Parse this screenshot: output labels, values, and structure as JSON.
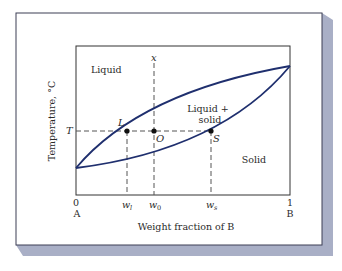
{
  "colors": {
    "frame": "#3c3f55",
    "shadow": "#a9afc6",
    "curve": "#1f2f6e",
    "axis": "#333333",
    "dash": "#555555",
    "point": "#111111",
    "background": "#ffffff"
  },
  "diagram": {
    "type": "binary isomorphous phase diagram",
    "regions": {
      "liquid": "Liquid",
      "two_phase_line1": "Liquid +",
      "two_phase_line2": "solid",
      "solid": "Solid"
    },
    "axes": {
      "ylabel": "Temperature, °C",
      "xlabel": "Weight fraction of B",
      "x_left_value": "0",
      "x_left_label": "A",
      "x_right_value": "1",
      "x_right_label": "B",
      "t_label": "T"
    },
    "ticks": {
      "wl": "w",
      "wl_sub": "l",
      "w0": "w",
      "w0_sub": "0",
      "ws": "w",
      "ws_sub": "s"
    },
    "points": {
      "L": "L",
      "O": "O",
      "S": "S"
    },
    "vertical_line_label": "x"
  }
}
